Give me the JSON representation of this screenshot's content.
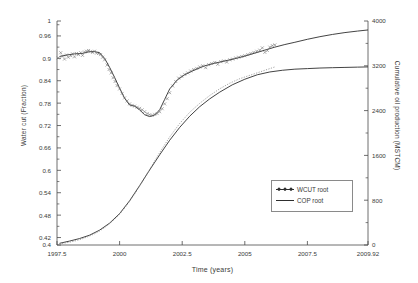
{
  "chart_data": {
    "type": "line",
    "title": "",
    "xlabel": "Time (years)",
    "ylabel": "Water cut (Fraction)",
    "ylabel_right": "Cumulative oil production (MSTCM)",
    "xlim": [
      1997.5,
      2009.92
    ],
    "ylim": [
      0.4,
      1.0
    ],
    "ylim_right": [
      0,
      4000
    ],
    "grid": false,
    "legend_position": "center-right",
    "xticks": [
      "1997.5",
      "2000",
      "2002.5",
      "2005",
      "2007.5",
      "2009.92"
    ],
    "xtick_values": [
      1997.5,
      2000,
      2002.5,
      2005,
      2007.5,
      2009.92
    ],
    "yticks_left": [
      "0.4",
      "0.42",
      "0.48",
      "0.54",
      "0.6",
      "0.66",
      "0.72",
      "0.78",
      "0.84",
      "0.9",
      "0.96",
      "1"
    ],
    "ytick_values_left": [
      0.4,
      0.42,
      0.48,
      0.54,
      0.6,
      0.66,
      0.72,
      0.78,
      0.84,
      0.9,
      0.96,
      1.0
    ],
    "yticks_right": [
      "0",
      "800",
      "1600",
      "2400",
      "3200",
      "4000"
    ],
    "ytick_values_right": [
      0,
      800,
      1600,
      2400,
      3200,
      4000
    ],
    "legend": [
      {
        "label": "WCUT root",
        "style": "line-with-markers",
        "axis": "left"
      },
      {
        "label": "COP root",
        "style": "line",
        "axis": "right"
      }
    ],
    "series": [
      {
        "name": "WCUT root",
        "axis": "left",
        "style": "line",
        "color": "#2e2e2e",
        "x": [
          1997.6,
          1997.9,
          1998.2,
          1998.5,
          1998.8,
          1999.0,
          1999.2,
          1999.4,
          1999.6,
          1999.8,
          2000.0,
          2000.2,
          2000.4,
          2000.6,
          2000.8,
          2001.0,
          2001.2,
          2001.4,
          2001.6,
          2001.8,
          2002.0,
          2002.3,
          2002.6,
          2003.0,
          2003.4,
          2003.8,
          2004.2,
          2004.6,
          2005.0,
          2005.4,
          2005.8,
          2006.2,
          2006.6,
          2007.0,
          2007.5,
          2008.0,
          2008.5,
          2009.0,
          2009.5,
          2009.92
        ],
        "y": [
          0.905,
          0.909,
          0.912,
          0.913,
          0.918,
          0.918,
          0.915,
          0.9,
          0.876,
          0.849,
          0.82,
          0.793,
          0.775,
          0.772,
          0.762,
          0.749,
          0.744,
          0.748,
          0.762,
          0.79,
          0.818,
          0.842,
          0.856,
          0.869,
          0.88,
          0.887,
          0.893,
          0.899,
          0.906,
          0.914,
          0.922,
          0.93,
          0.937,
          0.943,
          0.951,
          0.958,
          0.964,
          0.969,
          0.973,
          0.976
        ]
      },
      {
        "name": "WCUT root (observed)",
        "axis": "left",
        "style": "markers",
        "marker": "x",
        "color": "#6b6b6b",
        "x": [
          1997.55,
          1997.65,
          1997.72,
          1997.8,
          1997.88,
          1997.95,
          1998.05,
          1998.12,
          1998.2,
          1998.28,
          1998.36,
          1998.45,
          1998.52,
          1998.6,
          1998.68,
          1998.76,
          1998.84,
          1998.92,
          1999.0,
          1999.08,
          1999.16,
          1999.24,
          1999.32,
          1999.4,
          1999.5,
          1999.58,
          1999.66,
          1999.74,
          1999.82,
          1999.9,
          2000.0,
          2000.1,
          2000.2,
          2000.3,
          2000.4,
          2000.5,
          2000.6,
          2000.7,
          2000.8,
          2000.9,
          2001.0,
          2001.1,
          2001.2,
          2001.3,
          2001.4,
          2001.5,
          2001.6,
          2001.7,
          2001.8,
          2001.9,
          2002.0,
          2002.12,
          2002.24,
          2002.36,
          2002.48,
          2002.6,
          2002.72,
          2002.84,
          2002.96,
          2003.08,
          2003.2,
          2003.32,
          2003.44,
          2003.56,
          2003.68,
          2003.8,
          2003.92,
          2004.04,
          2004.16,
          2004.28,
          2004.4,
          2004.52,
          2004.64,
          2004.76,
          2004.88,
          2005.0,
          2005.12,
          2005.24,
          2005.36,
          2005.48,
          2005.6,
          2005.7,
          2005.8,
          2005.9,
          2006.0,
          2006.1,
          2006.2
        ],
        "y": [
          0.901,
          0.915,
          0.906,
          0.898,
          0.909,
          0.903,
          0.907,
          0.912,
          0.904,
          0.913,
          0.91,
          0.915,
          0.908,
          0.917,
          0.919,
          0.921,
          0.918,
          0.916,
          0.919,
          0.914,
          0.913,
          0.91,
          0.903,
          0.896,
          0.882,
          0.87,
          0.861,
          0.848,
          0.838,
          0.827,
          0.818,
          0.806,
          0.794,
          0.786,
          0.778,
          0.774,
          0.772,
          0.769,
          0.766,
          0.762,
          0.757,
          0.752,
          0.749,
          0.747,
          0.75,
          0.752,
          0.757,
          0.765,
          0.778,
          0.792,
          0.808,
          0.826,
          0.838,
          0.847,
          0.852,
          0.857,
          0.861,
          0.866,
          0.87,
          0.873,
          0.877,
          0.88,
          0.875,
          0.883,
          0.886,
          0.889,
          0.884,
          0.891,
          0.893,
          0.89,
          0.896,
          0.898,
          0.901,
          0.903,
          0.905,
          0.907,
          0.91,
          0.913,
          0.916,
          0.919,
          0.922,
          0.928,
          0.916,
          0.921,
          0.93,
          0.934,
          0.936
        ]
      },
      {
        "name": "COP root",
        "axis": "right",
        "style": "line",
        "color": "#2e2e2e",
        "x": [
          1997.6,
          1998.0,
          1998.4,
          1998.8,
          1999.2,
          1999.6,
          2000.0,
          2000.4,
          2000.8,
          2001.2,
          2001.6,
          2002.0,
          2002.4,
          2002.8,
          2003.2,
          2003.6,
          2004.0,
          2004.5,
          2005.0,
          2005.5,
          2006.0,
          2006.5,
          2007.0,
          2007.5,
          2008.0,
          2008.5,
          2009.0,
          2009.5,
          2009.92
        ],
        "y": [
          30,
          70,
          115,
          175,
          265,
          390,
          560,
          790,
          1060,
          1340,
          1610,
          1870,
          2100,
          2300,
          2470,
          2610,
          2730,
          2860,
          2960,
          3040,
          3090,
          3120,
          3140,
          3150,
          3160,
          3166,
          3171,
          3176,
          3180
        ]
      },
      {
        "name": "COP root (observed)",
        "axis": "right",
        "style": "markers",
        "marker": "dot",
        "color": "#8a8a8a",
        "x": [
          1997.6,
          1997.8,
          1998.0,
          1998.2,
          1998.4,
          1998.6,
          1998.8,
          1999.0,
          1999.2,
          1999.4,
          1999.6,
          1999.8,
          2000.0,
          2000.2,
          2000.4,
          2000.6,
          2000.8,
          2001.0,
          2001.2,
          2001.4,
          2001.6,
          2001.8,
          2002.0,
          2002.2,
          2002.4,
          2002.6,
          2002.8,
          2003.0,
          2003.2,
          2003.4,
          2003.6,
          2003.8,
          2004.0,
          2004.2,
          2004.4,
          2004.6,
          2004.8,
          2005.0,
          2005.2,
          2005.4,
          2005.6,
          2005.8,
          2006.0,
          2006.2
        ],
        "y": [
          20,
          35,
          50,
          70,
          95,
          125,
          160,
          200,
          250,
          310,
          380,
          460,
          550,
          660,
          780,
          910,
          1050,
          1200,
          1350,
          1500,
          1650,
          1790,
          1930,
          2050,
          2170,
          2270,
          2370,
          2450,
          2530,
          2600,
          2670,
          2730,
          2790,
          2840,
          2890,
          2930,
          2970,
          3000,
          3030,
          3060,
          3090,
          3120,
          3150,
          3180
        ]
      }
    ]
  },
  "legend": {
    "items": [
      {
        "label": "WCUT root"
      },
      {
        "label": "COP root"
      }
    ]
  }
}
